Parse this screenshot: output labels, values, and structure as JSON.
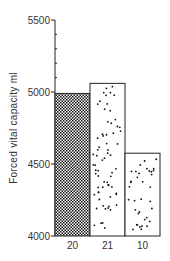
{
  "chart_data": {
    "type": "bar",
    "title": "",
    "xlabel": "",
    "ylabel": "Forced vital capacity  ml",
    "categories": [
      "20",
      "21",
      "10"
    ],
    "values": [
      4990,
      5060,
      4575
    ],
    "patterns": [
      "crosshatch-dense",
      "sparse-dots",
      "sparse-dots"
    ],
    "ylim": [
      4000,
      5500
    ],
    "yticks_major": [
      4000,
      4500,
      5000,
      5500
    ],
    "yticks_minor_step": 100,
    "grid": false,
    "legend": null
  },
  "labels": {
    "y_axis": "Forced vital capacity  ml",
    "yticks": [
      "4000",
      "4500",
      "5000",
      "5500"
    ],
    "xticks": [
      "20",
      "21",
      "10"
    ]
  }
}
